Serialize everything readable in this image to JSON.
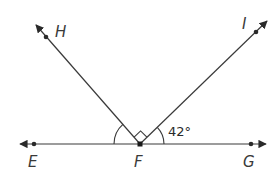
{
  "diagram": {
    "type": "geometry-angles",
    "vertex": "F",
    "points": {
      "H": {
        "label": "H"
      },
      "I": {
        "label": "I"
      },
      "E": {
        "label": "E"
      },
      "F": {
        "label": "F"
      },
      "G": {
        "label": "G"
      }
    },
    "rays": [
      "FH",
      "FI",
      "FE",
      "FG"
    ],
    "angles": [
      {
        "name": "angle-HFI",
        "marker": "right-angle"
      },
      {
        "name": "angle-IFG",
        "label": "42°"
      },
      {
        "name": "angle-EFH",
        "marker": "arc"
      }
    ],
    "colors": {
      "line": "#3a3a3a",
      "text": "#3a3a3a"
    }
  }
}
